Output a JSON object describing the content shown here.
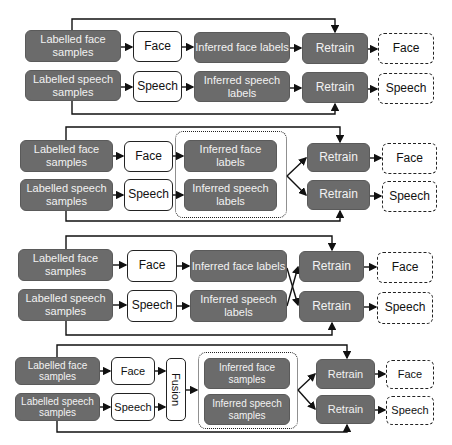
{
  "diagram": {
    "colors": {
      "data_box": "#6b6b6b",
      "data_text": "#f2f2f2",
      "line": "#111111",
      "model_border": "#222222"
    },
    "panels": [
      {
        "id": "panel-1",
        "labelled_face": "Labelled face samples",
        "labelled_speech": "Labelled speech samples",
        "face_model": "Face",
        "speech_model": "Speech",
        "inferred_face": "Inferred face labels",
        "inferred_speech": "Inferred speech labels",
        "retrain_face": "Retrain",
        "retrain_speech": "Retrain",
        "out_face": "Face",
        "out_speech": "Speech"
      },
      {
        "id": "panel-2",
        "labelled_face": "Labelled face samples",
        "labelled_speech": "Labelled speech samples",
        "face_model": "Face",
        "speech_model": "Speech",
        "inferred_face": "Inferred face labels",
        "inferred_speech": "Inferred speech labels",
        "retrain_face": "Retrain",
        "retrain_speech": "Retrain",
        "out_face": "Face",
        "out_speech": "Speech"
      },
      {
        "id": "panel-3",
        "labelled_face": "Labelled face samples",
        "labelled_speech": "Labelled speech samples",
        "face_model": "Face",
        "speech_model": "Speech",
        "inferred_face": "Inferred face labels",
        "inferred_speech": "Inferred speech labels",
        "retrain_face": "Retrain",
        "retrain_speech": "Retrain",
        "out_face": "Face",
        "out_speech": "Speech"
      },
      {
        "id": "panel-4",
        "labelled_face": "Labelled face samples",
        "labelled_speech": "Labelled speech samples",
        "face_model": "Face",
        "speech_model": "Speech",
        "fusion": "Fusion",
        "inferred_face": "Inferred face samples",
        "inferred_speech": "Inferred speech samples",
        "retrain_face": "Retrain",
        "retrain_speech": "Retrain",
        "out_face": "Face",
        "out_speech": "Speech"
      }
    ]
  }
}
